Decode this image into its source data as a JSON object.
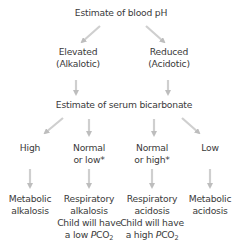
{
  "diagram": {
    "root": {
      "label": "Estimate of blood pH"
    },
    "ph_branches": [
      {
        "line1": "Elevated",
        "line2": "(Alkalotic)"
      },
      {
        "line1": "Reduced",
        "line2": "(Acidotic)"
      }
    ],
    "bicarbonate": {
      "label": "Estimate of serum bicarbonate"
    },
    "bicarbonate_branches": [
      {
        "line1": "High",
        "line2": ""
      },
      {
        "line1": "Normal",
        "line2": "or low*"
      },
      {
        "line1": "Normal",
        "line2": "or high*"
      },
      {
        "line1": "Low",
        "line2": ""
      }
    ],
    "outcomes": [
      {
        "line1": "Metabolic",
        "line2": "alkalosis",
        "line3": "",
        "line4_prefix": "",
        "line4_var": "",
        "line4_sub": ""
      },
      {
        "line1": "Respiratory",
        "line2": "alkalosis",
        "line3": "Child will have",
        "line4_prefix": "a low ",
        "line4_var": "P",
        "line4_chem": "CO",
        "line4_sub": "2"
      },
      {
        "line1": "Respiratory",
        "line2": "acidosis",
        "line3": "Child will have",
        "line4_prefix": "a high ",
        "line4_var": "P",
        "line4_chem": "CO",
        "line4_sub": "2"
      },
      {
        "line1": "Metabolic",
        "line2": "acidosis",
        "line3": "",
        "line4_prefix": "",
        "line4_var": "",
        "line4_sub": ""
      }
    ],
    "colors": {
      "text": "#3a3a3a",
      "arrow": "#c4c4c4",
      "background": "#ffffff"
    }
  }
}
